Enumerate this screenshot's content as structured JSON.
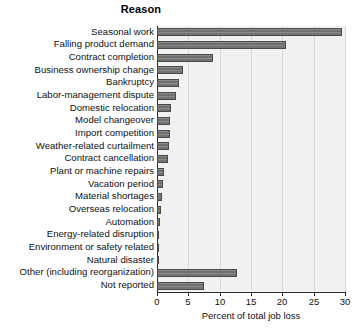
{
  "chart_data": {
    "type": "bar",
    "orientation": "horizontal",
    "title": "Reason",
    "xlabel": "Percent of total job loss",
    "ylabel": "",
    "xlim": [
      0,
      30
    ],
    "xticks": [
      0,
      5,
      10,
      15,
      20,
      25,
      30
    ],
    "xticklabels": [
      "0",
      "5",
      "10",
      "15",
      "20",
      "25",
      "30"
    ],
    "grid": true,
    "legend": null,
    "categories": [
      "Seasonal work",
      "Falling product demand",
      "Contract completion",
      "Business ownership change",
      "Bankruptcy",
      "Labor-management dispute",
      "Domestic relocation",
      "Model changeover",
      "Import competition",
      "Weather-related curtailment",
      "Contract cancellation",
      "Plant or machine repairs",
      "Vacation period",
      "Material shortages",
      "Overseas relocation",
      "Automation",
      "Energy-related disruption",
      "Environment or safety related",
      "Natural disaster",
      "Other (including reorganization)",
      "Not reported"
    ],
    "values": [
      29.5,
      20.6,
      8.9,
      4.2,
      3.5,
      3.1,
      2.3,
      2.1,
      2.0,
      1.9,
      1.7,
      1.1,
      1.0,
      0.8,
      0.6,
      0.4,
      0.3,
      0.3,
      0.2,
      12.7,
      7.5
    ],
    "colors": {
      "bar_fill": "#7d7d7d",
      "bar_edge": "#4a4a4a",
      "plot_background": "#f1f1f1",
      "axis": "#2b2b2b",
      "gridline": "#d8d8d8",
      "text": "#111111"
    }
  }
}
